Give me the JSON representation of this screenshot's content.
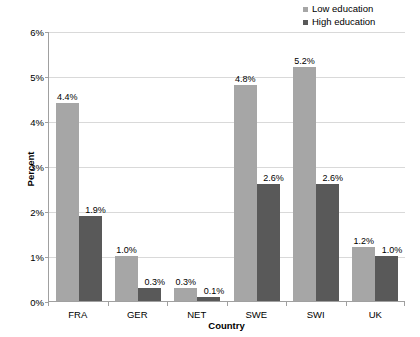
{
  "legend": {
    "position": "top-right",
    "items": [
      {
        "label": "Low education",
        "color": "#a6a6a6",
        "icon": "square-swatch-icon"
      },
      {
        "label": "High education",
        "color": "#595959",
        "icon": "square-swatch-icon"
      }
    ]
  },
  "axes": {
    "y": {
      "label": "Percent",
      "ticks": [
        "0%",
        "1%",
        "2%",
        "3%",
        "4%",
        "5%",
        "6%"
      ],
      "min": 0,
      "max": 6
    },
    "x": {
      "label": "Country",
      "ticks": [
        "FRA",
        "GER",
        "NET",
        "SWE",
        "SWI",
        "UK"
      ]
    }
  },
  "chart_data": {
    "type": "bar",
    "title": "",
    "xlabel": "Country",
    "ylabel": "Percent",
    "ylim": [
      0,
      6
    ],
    "ytick_labels": [
      "0%",
      "1%",
      "2%",
      "3%",
      "4%",
      "5%",
      "6%"
    ],
    "grid": true,
    "legend_position": "top-right",
    "categories": [
      "FRA",
      "GER",
      "NET",
      "SWE",
      "SWI",
      "UK"
    ],
    "series": [
      {
        "name": "Low education",
        "color": "#a6a6a6",
        "values": [
          4.4,
          1.0,
          0.3,
          4.8,
          5.2,
          1.2
        ],
        "labels": [
          "4.4%",
          "1.0%",
          "0.3%",
          "4.8%",
          "5.2%",
          "1.2%"
        ]
      },
      {
        "name": "High education",
        "color": "#595959",
        "values": [
          1.9,
          0.3,
          0.1,
          2.6,
          2.6,
          1.0
        ],
        "labels": [
          "1.9%",
          "0.3%",
          "0.1%",
          "2.6%",
          "2.6%",
          "1.0%"
        ]
      }
    ]
  }
}
